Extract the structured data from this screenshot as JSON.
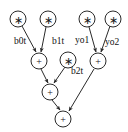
{
  "diagram": {
    "type": "computation-graph",
    "background_color": "#ffffff",
    "stroke_color": "#2a2a2a",
    "text_color": "#111111",
    "width": 128,
    "height": 132,
    "nodes": [
      {
        "id": "mul_b0",
        "op": "*",
        "glyph": "∗",
        "kind": "multiply",
        "cx": 18,
        "cy": 19,
        "r": 8
      },
      {
        "id": "mul_b1",
        "op": "*",
        "glyph": "∗",
        "kind": "multiply",
        "cx": 48,
        "cy": 19,
        "r": 8
      },
      {
        "id": "mul_y1",
        "op": "*",
        "glyph": "∗",
        "kind": "multiply",
        "cx": 87,
        "cy": 19,
        "r": 8
      },
      {
        "id": "mul_y2",
        "op": "*",
        "glyph": "∗",
        "kind": "multiply",
        "cx": 113,
        "cy": 19,
        "r": 8
      },
      {
        "id": "mul_b2",
        "op": "*",
        "glyph": "∗",
        "kind": "multiply",
        "cx": 68,
        "cy": 60,
        "r": 8
      },
      {
        "id": "add_left",
        "op": "+",
        "glyph": "+",
        "kind": "add",
        "cx": 39,
        "cy": 61,
        "r": 8
      },
      {
        "id": "add_right",
        "op": "+",
        "glyph": "+",
        "kind": "add",
        "cx": 98,
        "cy": 61,
        "r": 8
      },
      {
        "id": "add_mid",
        "op": "+",
        "glyph": "+",
        "kind": "add",
        "cx": 50,
        "cy": 92,
        "r": 8
      },
      {
        "id": "add_bottom",
        "op": "+",
        "glyph": "+",
        "kind": "add",
        "cx": 63,
        "cy": 119,
        "r": 8
      }
    ],
    "edges": [
      {
        "id": "e_b0t",
        "from": "mul_b0",
        "to": "add_left",
        "label": "b0t",
        "label_x": 20,
        "label_y": 43,
        "x1": 22,
        "y1": 26,
        "x2": 36,
        "y2": 53
      },
      {
        "id": "e_b1t",
        "from": "mul_b1",
        "to": "add_left",
        "label": "b1t",
        "label_x": 58,
        "label_y": 43,
        "x1": 46,
        "y1": 27,
        "x2": 41,
        "y2": 53
      },
      {
        "id": "e_yo1",
        "from": "mul_y1",
        "to": "add_right",
        "label": "yo1",
        "label_x": 82,
        "label_y": 42,
        "x1": 89,
        "y1": 27,
        "x2": 96,
        "y2": 53
      },
      {
        "id": "e_yo2",
        "from": "mul_y2",
        "to": "add_right",
        "label": "yo2",
        "label_x": 112,
        "label_y": 44,
        "x1": 110,
        "y1": 26,
        "x2": 101,
        "y2": 53
      },
      {
        "id": "e_b2t",
        "from": "mul_b2",
        "to": "add_mid",
        "label": "b2t",
        "label_x": 76,
        "label_y": 73,
        "x1": 65,
        "y1": 67,
        "x2": 53,
        "y2": 84
      },
      {
        "id": "e_left_mid",
        "from": "add_left",
        "to": "add_mid",
        "label": "",
        "label_x": 0,
        "label_y": 0,
        "x1": 41,
        "y1": 69,
        "x2": 48,
        "y2": 84
      },
      {
        "id": "e_mid_bottom",
        "from": "add_mid",
        "to": "add_bottom",
        "label": "",
        "label_x": 0,
        "label_y": 0,
        "x1": 52,
        "y1": 100,
        "x2": 60,
        "y2": 111
      },
      {
        "id": "e_right_bottom",
        "from": "add_right",
        "to": "add_bottom",
        "label": "",
        "label_x": 0,
        "label_y": 0,
        "x1": 95,
        "y1": 69,
        "x2": 69,
        "y2": 112
      }
    ],
    "edge_labels": [
      "b0t",
      "b1t",
      "yo1",
      "yo2",
      "b2t"
    ],
    "operators": {
      "multiply": "∗",
      "add": "+"
    }
  }
}
